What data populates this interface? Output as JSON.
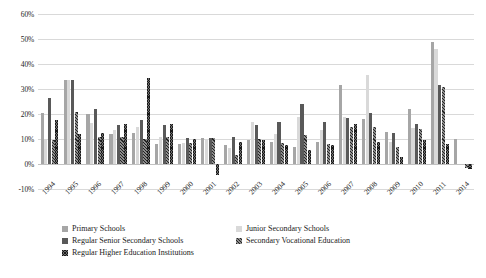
{
  "chart_data": {
    "type": "bar",
    "title": "",
    "subtitle": "",
    "xlabel": "",
    "ylabel": "",
    "ylim": [
      -10,
      60
    ],
    "yticks": [
      "-10%",
      "0%",
      "10%",
      "20%",
      "30%",
      "40%",
      "50%",
      "60%"
    ],
    "ytick_values": [
      -10,
      0,
      10,
      20,
      30,
      40,
      50,
      60
    ],
    "grid": true,
    "legend_position": "bottom",
    "categories": [
      "1994",
      "1995",
      "1996",
      "1997",
      "1998",
      "1999",
      "2000",
      "2001",
      "2002",
      "2003",
      "2004",
      "2005",
      "2006",
      "2007",
      "2008",
      "2009",
      "2010",
      "2011",
      "2014"
    ],
    "series": [
      {
        "name": "Primary Schools",
        "swatch": "#a6a6a6",
        "values": [
          20.5,
          33.8,
          20.0,
          12.0,
          12.5,
          8.0,
          8.0,
          10.5,
          7.5,
          9.5,
          9.0,
          7.0,
          9.0,
          31.5,
          18.0,
          13.0,
          22.0,
          49.0,
          10.0
        ]
      },
      {
        "name": "Junior Secondary Schools",
        "swatch": "#d9d9d9",
        "values": [
          10.0,
          33.5,
          16.5,
          13.5,
          15.0,
          11.0,
          8.5,
          10.0,
          6.5,
          17.0,
          12.0,
          19.0,
          13.5,
          19.0,
          35.5,
          9.0,
          14.5,
          46.0,
          0.0
        ]
      },
      {
        "name": "Regular Senior Secondary Schools",
        "swatch": "#595959",
        "values": [
          26.5,
          33.5,
          22.0,
          15.5,
          17.5,
          15.5,
          10.5,
          10.5,
          11.0,
          15.5,
          17.0,
          24.0,
          17.0,
          18.5,
          20.5,
          12.5,
          16.0,
          31.5,
          0.0
        ]
      },
      {
        "name": "Secondary Vocational Education",
        "swatch": "#8c8c8c",
        "values": [
          9.5,
          21.0,
          11.0,
          11.0,
          10.0,
          11.0,
          8.5,
          10.5,
          3.5,
          10.0,
          8.5,
          11.5,
          8.0,
          15.0,
          15.0,
          7.0,
          14.0,
          31.0,
          -1.5
        ]
      },
      {
        "name": "Regular Higher Education Institutions",
        "swatch": "#6e6e6e",
        "values": [
          17.5,
          12.0,
          12.5,
          16.0,
          34.5,
          16.0,
          10.0,
          -4.5,
          9.0,
          9.5,
          7.5,
          5.5,
          7.5,
          16.0,
          9.0,
          3.0,
          9.5,
          8.0,
          -2.0
        ]
      }
    ]
  }
}
